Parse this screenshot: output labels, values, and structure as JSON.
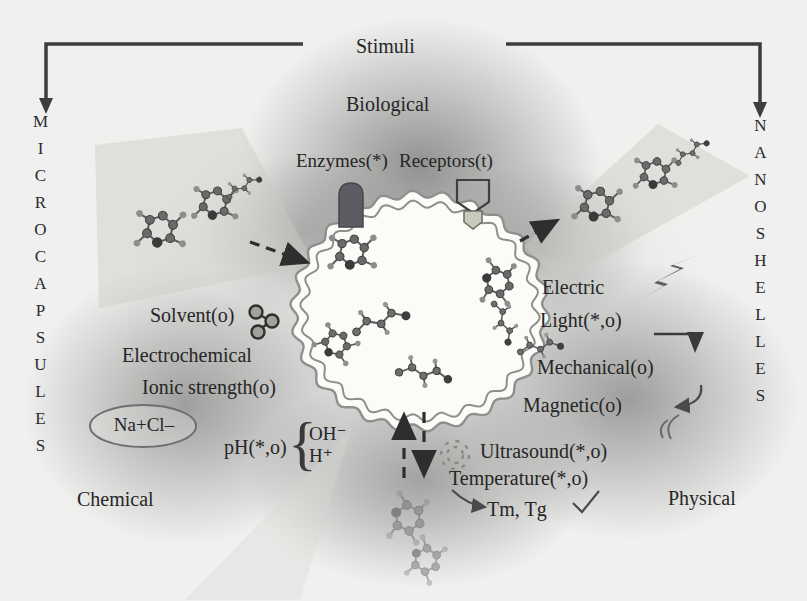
{
  "figure": {
    "title": "Stimuli",
    "side_left": "MICROCAPSULES",
    "side_right": "NANOSHELLES"
  },
  "categories": {
    "biological": "Biological",
    "chemical": "Chemical",
    "physical": "Physical"
  },
  "biological": {
    "enzymes": "Enzymes(*)",
    "receptors": "Receptors(t)"
  },
  "chemical": {
    "solvent": "Solvent(o)",
    "electrochemical": "Electrochemical",
    "ionic_strength": "Ionic strength(o)",
    "salt": "Na+Cl–",
    "ph": "pH(*,o)",
    "brace": "{",
    "hydroxide": "OH⁻",
    "proton": "H⁺"
  },
  "physical": {
    "electric": "Electric",
    "light": "Light(*,o)",
    "mechanical": "Mechanical(o)",
    "magnetic": "Magnetic(o)",
    "ultrasound": "Ultrasound(*,o)",
    "temperature": "Temperature(*,o)",
    "transitions": "Tm, Tg"
  },
  "icons": {
    "left_arrow": "down-arrow-icon",
    "right_arrow": "down-arrow-icon",
    "enzyme": "enzyme-cylinder-icon",
    "receptor": "receptor-cup-icon",
    "solvent": "solvent-molecule-icon",
    "lightning": "lightning-bolt-icon",
    "mechanical": "press-arrow-icon",
    "magnetic": "curved-arrow-icon",
    "ultrasound": "sputter-dashes-icon",
    "salt": "ellipse-outline-icon",
    "capsule": "wavy-capsule-icon",
    "molecules": "ball-and-stick-molecule-icon"
  },
  "colors": {
    "text": "#262626",
    "line": "#3a3a3a",
    "capsule_fill": "#fbfbf8",
    "capsule_stroke": "#8f8f8f",
    "enzyme_fill": "#5c5c63",
    "bolt_fill": "#5f5f5f",
    "cloud": "#6e6e6e"
  }
}
